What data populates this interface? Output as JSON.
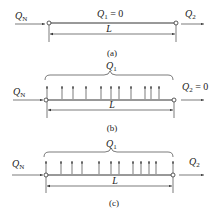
{
  "panels": [
    {
      "id": "a",
      "caption": "(a)",
      "inflow": {
        "symbol": "Q",
        "subscript": "N"
      },
      "distributed": {
        "symbol": "Q",
        "subscript": "1",
        "suffix": " = 0"
      },
      "outflow": {
        "symbol": "Q",
        "subscript": "2",
        "suffix": ""
      },
      "length_label": "L",
      "uniform_outflow_arrows": 0
    },
    {
      "id": "b",
      "caption": "(b)",
      "inflow": {
        "symbol": "Q",
        "subscript": "N"
      },
      "distributed": {
        "symbol": "Q",
        "subscript": "1",
        "suffix": ""
      },
      "outflow": {
        "symbol": "Q",
        "subscript": "2",
        "suffix": " = 0"
      },
      "length_label": "L",
      "uniform_outflow_arrows": 11
    },
    {
      "id": "c",
      "caption": "(c)",
      "inflow": {
        "symbol": "Q",
        "subscript": "N"
      },
      "distributed": {
        "symbol": "Q",
        "subscript": "1",
        "suffix": ""
      },
      "outflow": {
        "symbol": "Q",
        "subscript": "2",
        "suffix": ""
      },
      "length_label": "L",
      "uniform_outflow_arrows": 12
    }
  ]
}
